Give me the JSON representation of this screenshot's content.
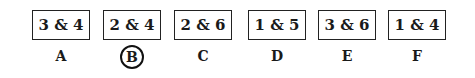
{
  "options": [
    {
      "value": "3 & 4",
      "letter": "A",
      "selected": false
    },
    {
      "value": "2 & 4",
      "letter": "B",
      "selected": true
    },
    {
      "value": "2 & 6",
      "letter": "C",
      "selected": false
    },
    {
      "value": "1 & 5",
      "letter": "D",
      "selected": false
    },
    {
      "value": "3 & 6",
      "letter": "E",
      "selected": false
    },
    {
      "value": "1 & 4",
      "letter": "F",
      "selected": false
    }
  ]
}
